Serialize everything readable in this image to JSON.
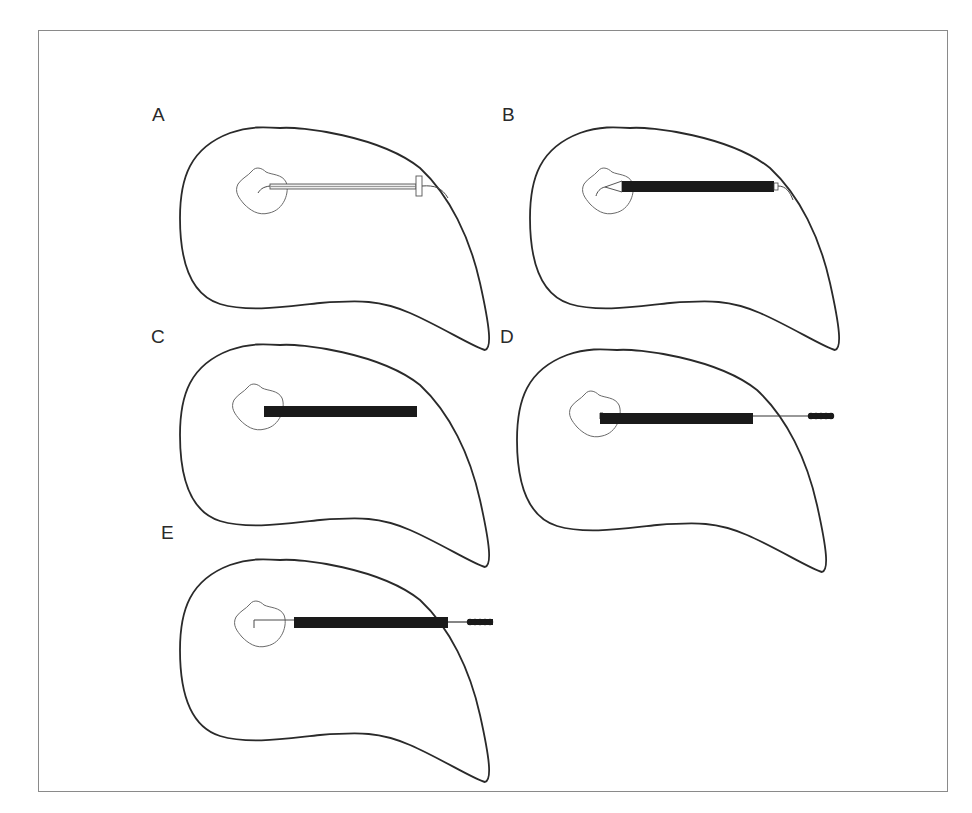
{
  "figure": {
    "type": "procedural-diagram",
    "panels": [
      {
        "label": "A",
        "instrument": "hollow needle with hub and guide wire",
        "bar_style": "outline"
      },
      {
        "label": "B",
        "instrument": "dark sheath/cannula over wire, tip inside lesion",
        "bar_style": "solid"
      },
      {
        "label": "C",
        "instrument": "dark sheath only, no wire",
        "bar_style": "solid"
      },
      {
        "label": "D",
        "instrument": "sheath with wire and threaded screw end",
        "bar_style": "solid"
      },
      {
        "label": "E",
        "instrument": "sheath retracted, wire hooked in lesion, threaded screw end",
        "bar_style": "solid"
      }
    ]
  },
  "colors": {
    "frame": "#8a8a8a",
    "outline": "#2a2a2a",
    "lesion": "#6a6a6a",
    "bar": "#1a1a1a"
  }
}
